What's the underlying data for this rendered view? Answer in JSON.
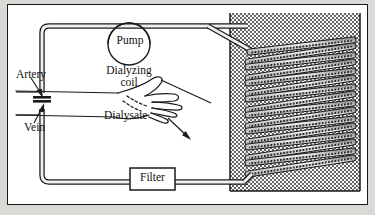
{
  "figure": {
    "type": "diagram",
    "background_color": "#d9d9d6",
    "page_color": "#ffffff",
    "ink_color": "#111111"
  },
  "labels": {
    "pump": "Pump",
    "artery": "Artery",
    "vein": "Vein",
    "filter": "Filter",
    "dialyzing_coil_line1": "Dialyzing",
    "dialyzing_coil_line2": "coil",
    "dialysate": "Dialysate"
  },
  "components": {
    "pump": {
      "shape": "circle",
      "label_inside": true
    },
    "filter": {
      "shape": "rectangle",
      "label_inside": true
    },
    "tank": {
      "name": "dialysate-tank",
      "fill": "stipple-dots",
      "fill_color": "#6e6e6e"
    },
    "coil": {
      "name": "dialyzing-coil",
      "windings": 11,
      "style": "slanted-zigzag-tubes"
    },
    "arm": {
      "name": "patient-arm-and-hand",
      "style": "line-drawing"
    },
    "tubes": {
      "upper": "artery-to-pump-to-coil",
      "lower": "coil-to-filter-to-vein"
    }
  },
  "leaders": {
    "artery": "arrow-down-right",
    "vein": "arrow-up-right",
    "dialyzing_coil": "line-down-right",
    "dialysate": "arrow-down-right"
  }
}
